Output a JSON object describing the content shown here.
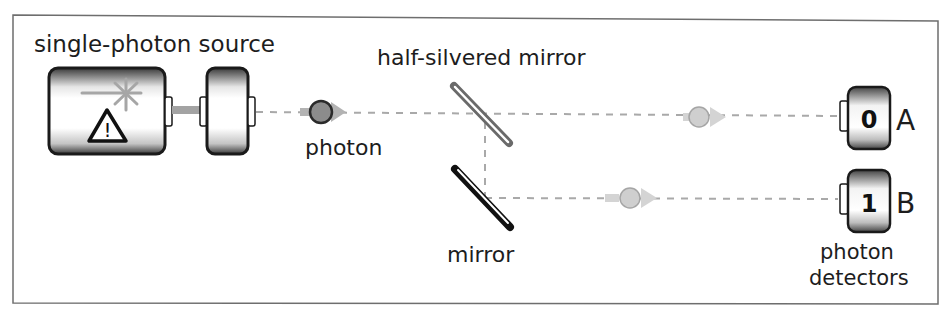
{
  "diagram": {
    "labels": {
      "source": "single-photon source",
      "half_silvered_mirror": "half-silvered mirror",
      "photon": "photon",
      "mirror": "mirror",
      "detectors_line1": "photon",
      "detectors_line2": "detectors"
    },
    "detectors": [
      {
        "id": "A",
        "digit": "0"
      },
      {
        "id": "B",
        "digit": "1"
      }
    ],
    "icons": {
      "laser": "asterisk-burst-icon",
      "warning": "warning-triangle-icon"
    },
    "colors": {
      "frame": "#6e6e6e",
      "beam": "#a9a9a9",
      "photon_primary": "#8c8c8c",
      "photon_faded": "#cfcfcf",
      "half_mirror": "#6a6a6a",
      "mirror": "#111111",
      "device_edge": "#1a1a1a"
    }
  }
}
